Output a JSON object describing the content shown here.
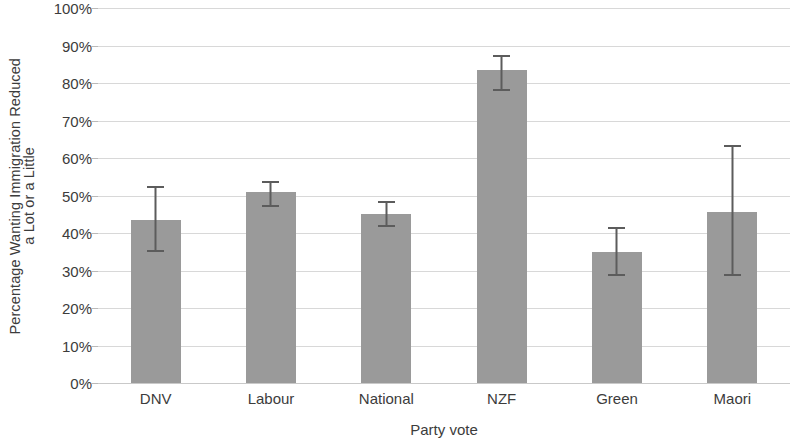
{
  "chart_data": {
    "type": "bar",
    "title": "",
    "xlabel": "Party vote",
    "ylabel": "Percentage Wanting Immigration Reduced a Lot or a Little",
    "ylabel_lines": [
      "Percentage Wanting Immigration Reduced",
      "a Lot or a Little"
    ],
    "categories": [
      "DNV",
      "Labour",
      "National",
      "NZF",
      "Green",
      "Maori"
    ],
    "values": [
      43.5,
      51,
      45,
      83.5,
      35,
      45.5
    ],
    "error_low": [
      35,
      47,
      41.5,
      78,
      28.5,
      28.5
    ],
    "error_high": [
      52.5,
      54,
      48.5,
      87.5,
      41.5,
      63.5
    ],
    "ylim": [
      0,
      100
    ],
    "ytick_values": [
      0,
      10,
      20,
      30,
      40,
      50,
      60,
      70,
      80,
      90,
      100
    ],
    "ytick_labels": [
      "0%",
      "10%",
      "20%",
      "30%",
      "40%",
      "50%",
      "60%",
      "70%",
      "80%",
      "90%",
      "100%"
    ],
    "grid": true,
    "legend": "none",
    "bar_color": "#9a9a9a",
    "error_color": "#5c5c5c",
    "grid_color": "#d8d8d8",
    "text_color": "#3c3c3c"
  }
}
